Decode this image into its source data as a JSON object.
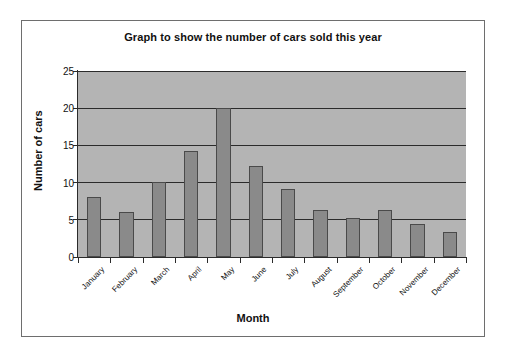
{
  "chart_data": {
    "type": "bar",
    "title": "Graph to show the number of cars sold this year",
    "xlabel": "Month",
    "ylabel": "Number of cars",
    "categories": [
      "January",
      "February",
      "March",
      "April",
      "May",
      "June",
      "July",
      "August",
      "September",
      "October",
      "November",
      "December"
    ],
    "values": [
      8.1,
      6.1,
      10.1,
      14.2,
      20.0,
      12.2,
      9.2,
      6.3,
      5.2,
      6.3,
      4.5,
      3.4
    ],
    "ylim": [
      0,
      25
    ],
    "yticks": [
      0,
      5,
      10,
      15,
      20,
      25
    ],
    "ytick_labels": [
      "0",
      "5",
      "10",
      "15",
      "20",
      "25"
    ],
    "grid": true,
    "grid_axis": "y",
    "legend": false,
    "legend_position": "none",
    "bar_color": "#8a8a8a",
    "bar_edge_color": "#4a4a4a",
    "plot_background_color": "#b4b4b4",
    "figure_background_color": "#ffffff",
    "axis_color": "#2b2b2b",
    "frame_border_color": "#6e6e6e",
    "xtick_label_rotation": -45
  }
}
